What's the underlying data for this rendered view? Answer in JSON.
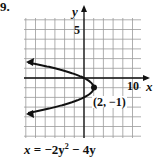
{
  "problem_number": "9.",
  "equation": "x = −2y² − 4y",
  "equation_parts": {
    "lhs": "x",
    "eq": "=",
    "t1": "−2y",
    "sup": "2",
    "t2": "− 4y"
  },
  "axes": {
    "x_label": "x",
    "y_label": "y",
    "x_tick_label": "10",
    "y_tick_label": "5"
  },
  "vertex_label": "(2, −1)",
  "colors": {
    "grid": "#9a9a9a",
    "axis": "#111111",
    "curve": "#111111"
  },
  "chart_data": {
    "type": "line",
    "xlabel": "x",
    "ylabel": "y",
    "xlim": [
      -12,
      12
    ],
    "ylim": [
      -6,
      6
    ],
    "x_grid_step": 2,
    "y_grid_step": 1,
    "grid": true,
    "annotations": [
      {
        "text": "(2, −1)",
        "x": 2,
        "y": -1
      }
    ],
    "series": [
      {
        "name": "x = -2y^2 - 4y",
        "points": [
          {
            "x": -12,
            "y": 1.65
          },
          {
            "x": -6,
            "y": 1
          },
          {
            "x": 0,
            "y": 0
          },
          {
            "x": 2,
            "y": -1
          },
          {
            "x": 0,
            "y": -2
          },
          {
            "x": -6,
            "y": -3
          },
          {
            "x": -12,
            "y": -3.65
          }
        ]
      }
    ]
  }
}
